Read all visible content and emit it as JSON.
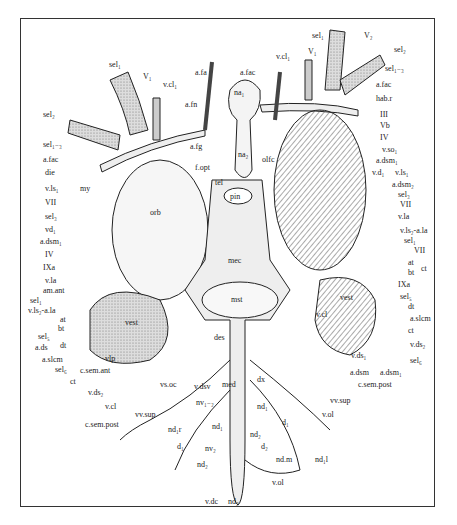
{
  "figure": {
    "labels": {
      "top": [
        "sel1",
        "V1",
        "v.cl1",
        "a.fa",
        "a.fn",
        "a.fac",
        "na1",
        "na2",
        "a.fg",
        "f.opt",
        "olfc",
        "tel",
        "pin",
        "V2",
        "sel2",
        "v.cl1",
        "sel1",
        "V2",
        "sel2"
      ],
      "left": [
        "sel2",
        "sel1-3",
        "a.fac",
        "die",
        "v.ls1",
        "my",
        "VII",
        "sel3",
        "vd1",
        "a.dsm1",
        "IV",
        "IXa",
        "v.la",
        "am.ant",
        "sel1",
        "v.ls2-a.la",
        "at",
        "bt",
        "sel5",
        "a.ds",
        "dt",
        "a.slcm",
        "sel6",
        "ct",
        "c.sem.ant",
        "vlp",
        "v.ds2",
        "v.cl",
        "c.sem.post",
        "vs.oc",
        "vv.sup"
      ],
      "right": [
        "sel1-3",
        "a.fac",
        "hab.r",
        "III",
        "Vb",
        "IV",
        "v.so1",
        "a.dsm1",
        "v.d1",
        "v.ls1",
        "a.dsm2",
        "sel3",
        "VII",
        "v.la",
        "v.ls2-a.la",
        "sel1",
        "VII",
        "at",
        "ct",
        "bt",
        "IXa",
        "sel5",
        "dt",
        "a.slcm",
        "ct",
        "v.ds2",
        "sel6",
        "v.ds1",
        "a.dsm",
        "a.dsm1",
        "c.sem.post",
        "vv.sup",
        "v.ol"
      ],
      "center": [
        "orb",
        "mec",
        "mst",
        "des",
        "vest",
        "v.cl",
        "med",
        "dx",
        "v.dsv",
        "nv1-2",
        "nd1",
        "nd1",
        "d1",
        "d1",
        "nd1.r",
        "nd2",
        "d2",
        "nv2",
        "nd2",
        "nd.m",
        "nd1.l",
        "v.ol",
        "v.dc",
        "nd2"
      ]
    }
  },
  "lbl": {
    "sel1_top": "sel₁",
    "V1": "V₁",
    "vcl1": "v.cl₁",
    "afa": "a.fa",
    "afn": "a.fn",
    "afac_top": "a.fac",
    "na1": "na₁",
    "na2": "na₂",
    "afg": "a.fg",
    "fopt": "f.opt",
    "olfc": "olfc",
    "tel": "tel",
    "pin": "pin",
    "sel2_l": "sel₂",
    "sel13_l": "sel₁₋₃",
    "afac_l": "a.fac",
    "die": "die",
    "vls1_l": "v.ls₁",
    "my": "my",
    "VII_l": "VII",
    "sel3_l": "sel₃",
    "vd1_l": "vd₁",
    "adsm1_l": "a.dsm₁",
    "IV_l": "IV",
    "IXa_l": "IXa",
    "vla_l": "v.la",
    "amant": "am.ant",
    "sel1_l": "sel₁",
    "vls2ala_l": "v.ls₂-a.la",
    "at_l": "at",
    "bt_l": "bt",
    "sel5_l": "sel₅",
    "ads_l": "a.ds",
    "dt_l": "dt",
    "aslcm_l": "a.slcm",
    "sel6_l": "sel₆",
    "ct_l": "ct",
    "csemant": "c.sem.ant",
    "vlp": "vlp",
    "vds2_l": "v.ds₂",
    "vcl_l": "v.cl",
    "csempost_l": "c.sem.post",
    "vsoc": "vs.oc",
    "vvsup_l": "vv.sup",
    "vcl1_r": "v.cl₁",
    "V1_r": "V₁",
    "sel1_r": "sel₁",
    "V2_r": "V₂",
    "sel2_r": "sel₂",
    "sel13_r": "sel₁₋₃",
    "afac_r": "a.fac",
    "habr": "hab.r",
    "III": "III",
    "Vb": "Vb",
    "IV_r": "IV",
    "vso1": "v.so₁",
    "adsm1_r": "a.dsm₁",
    "vd1_r": "v.d₁",
    "vls1_r": "v.ls₁",
    "adsm2": "a.dsm₂",
    "sel3_r": "sel₃",
    "VII_r": "VII",
    "vla_r": "v.la",
    "vls2ala_r": "v.ls₂-a.la",
    "sel1_r2": "sel₁",
    "VII_r2": "VII",
    "at_r": "at",
    "ct_r": "ct",
    "bt_r": "bt",
    "IXa_r": "IXa",
    "sel5_r": "sel₅",
    "dt_r": "dt",
    "aslcm_r": "a.slcm",
    "ct_r2": "ct",
    "vds2_r": "v.ds₂",
    "sel6_r": "sel₆",
    "vds1_r": "v.ds₁",
    "adsm_r": "a.dsm",
    "adsm1_r2": "a.dsm₁",
    "csempost_r": "c.sem.post",
    "vvsup_r": "vv.sup",
    "vol_r": "v.ol",
    "orb": "orb",
    "mec": "mec",
    "mst": "mst",
    "des": "des",
    "vest": "vest",
    "vest_r": "vest",
    "vcl_c": "v.cl",
    "med": "med",
    "dx": "dx",
    "vdsv": "v.dsv",
    "nv12": "nv₁₋₂",
    "nd1_a": "nd₁",
    "nd1_b": "nd₁",
    "d1_a": "d₁",
    "d1_b": "d₁",
    "nd1r": "nd₁r",
    "nd2_a": "nd₂",
    "d2": "d₂",
    "nv2": "nv₂",
    "nd2_b": "nd₂",
    "ndm": "nd.m",
    "nd1l": "nd₁l",
    "vol_c": "v.ol",
    "vdc": "v.dc",
    "nd2_c": "nd₂"
  }
}
